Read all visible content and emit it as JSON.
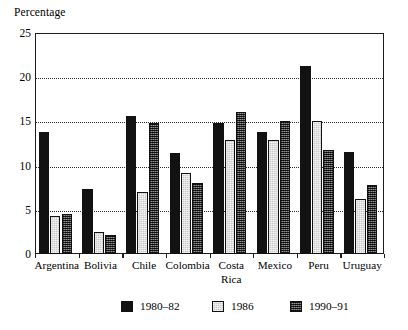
{
  "chart_data": {
    "type": "bar",
    "title": "",
    "ylabel": "Percentage",
    "xlabel": "",
    "ylim": [
      0,
      25
    ],
    "yticks": [
      0,
      5,
      10,
      15,
      20,
      25
    ],
    "grid": true,
    "grid_axis": "y",
    "legend_position": "bottom",
    "categories": [
      "Argentina",
      "Bolivia",
      "Chile",
      "Colombia",
      "Costa Rica",
      "Mexico",
      "Peru",
      "Uruguay"
    ],
    "category_labels": [
      "Argentina",
      "Bolivia",
      "Chile",
      "Colombia",
      "Costa\nRica",
      "Mexico",
      "Peru",
      "Uruguay"
    ],
    "series": [
      {
        "name": "1980–82",
        "color": "#121212",
        "values": [
          13.8,
          7.4,
          15.6,
          11.4,
          14.8,
          13.8,
          21.3,
          11.5
        ]
      },
      {
        "name": "1986",
        "color": "#c9c9c9",
        "values": [
          4.3,
          2.5,
          7.0,
          9.2,
          12.9,
          12.9,
          15.1,
          6.2
        ]
      },
      {
        "name": "1990–91",
        "color": "#4a4a4a",
        "values": [
          4.5,
          2.1,
          14.8,
          8.0,
          16.1,
          15.1,
          11.8,
          7.8
        ]
      }
    ]
  },
  "axis": {
    "y_title": "Percentage",
    "y_tick_labels": [
      "25",
      "20",
      "15",
      "10",
      "5",
      "0"
    ]
  },
  "legend": {
    "items": [
      {
        "label": "1980–82",
        "swatch": "series-0-swatch"
      },
      {
        "label": "1986",
        "swatch": "series-1-swatch"
      },
      {
        "label": "1990–91",
        "swatch": "series-2-swatch"
      }
    ]
  }
}
